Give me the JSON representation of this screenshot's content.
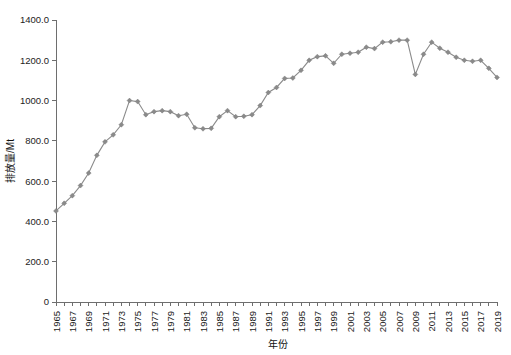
{
  "chart_data": {
    "type": "line",
    "title": "",
    "xlabel": "年份",
    "ylabel": "排放量/Mt",
    "xlim": [
      1965,
      2019
    ],
    "ylim": [
      0,
      1400
    ],
    "grid": false,
    "legend": null,
    "y_ticks": [
      "0",
      "200.0",
      "400.0",
      "600.0",
      "800.0",
      "1000.0",
      "1200.0",
      "1400.0"
    ],
    "y_tick_values": [
      0,
      200,
      400,
      600,
      800,
      1000,
      1200,
      1400
    ],
    "x_tick_labels": [
      "1965",
      "1967",
      "1969",
      "1971",
      "1973",
      "1975",
      "1977",
      "1979",
      "1981",
      "1983",
      "1985",
      "1987",
      "1989",
      "1991",
      "1993",
      "1995",
      "1997",
      "1999",
      "2001",
      "2003",
      "2005",
      "2007",
      "2009",
      "2011",
      "2013",
      "2015",
      "2017",
      "2019"
    ],
    "x": [
      1965,
      1966,
      1967,
      1968,
      1969,
      1970,
      1971,
      1972,
      1973,
      1974,
      1975,
      1976,
      1977,
      1978,
      1979,
      1980,
      1981,
      1982,
      1983,
      1984,
      1985,
      1986,
      1987,
      1988,
      1989,
      1990,
      1991,
      1992,
      1993,
      1994,
      1995,
      1996,
      1997,
      1998,
      1999,
      2000,
      2001,
      2002,
      2003,
      2004,
      2005,
      2006,
      2007,
      2008,
      2009,
      2010,
      2011,
      2012,
      2013,
      2014,
      2015,
      2016,
      2017,
      2018,
      2019
    ],
    "values": [
      452,
      490,
      528,
      578,
      640,
      728,
      795,
      830,
      880,
      1000,
      995,
      930,
      945,
      950,
      945,
      925,
      932,
      865,
      860,
      862,
      920,
      950,
      920,
      922,
      930,
      975,
      1040,
      1065,
      1110,
      1112,
      1150,
      1200,
      1218,
      1222,
      1185,
      1230,
      1235,
      1240,
      1265,
      1258,
      1290,
      1292,
      1300,
      1300,
      1130,
      1230,
      1290,
      1260,
      1240,
      1215,
      1200,
      1195,
      1200,
      1160,
      1115
    ],
    "series_color": "#8a8a8a",
    "marker_shape": "diamond",
    "marker_color": "#8a8a8a"
  },
  "axes": {
    "y_axis_name": "y-axis",
    "x_axis_name": "x-axis"
  }
}
